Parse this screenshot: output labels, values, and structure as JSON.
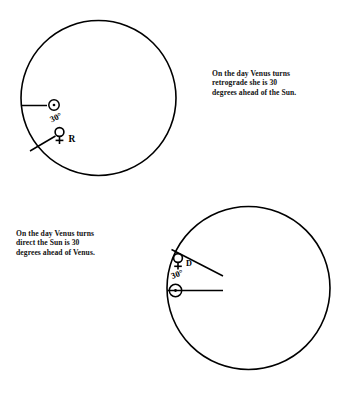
{
  "figure": {
    "background_color": "#ffffff",
    "ink_color": "#000000"
  },
  "captions": {
    "retrograde": "On the day Venus turns\nretrograde she is 30\ndegrees ahead of the Sun.",
    "direct": "On the day Venus turns\ndirect the Sun is 30\ndegrees ahead of Venus."
  },
  "diagrams": [
    {
      "id": "retrograde-chart",
      "name": "retrograde-wheel",
      "circle": {
        "cx": 98.5,
        "cy": 98,
        "r": 77.5
      },
      "bodies": [
        {
          "name": "sun",
          "symbol": "☉",
          "label": "",
          "x": 54,
          "y": 105,
          "radius_line": {
            "x1": 22,
            "y1": 105,
            "x2": 47,
            "y2": 105
          }
        },
        {
          "name": "venus",
          "symbol": "♀",
          "label": "R",
          "x": 60,
          "y": 135,
          "radius_line": {
            "x1": 31,
            "y1": 150,
            "x2": 54,
            "y2": 136
          }
        }
      ],
      "angle_label": "30°",
      "angle_label_x": 57,
      "angle_label_y": 120
    },
    {
      "id": "direct-chart",
      "name": "direct-wheel",
      "circle": {
        "cx": 248.5,
        "cy": 288,
        "r": 81.5
      },
      "bodies": [
        {
          "name": "venus",
          "symbol": "♀",
          "label": "D",
          "x": 178,
          "y": 260,
          "radius_line": {
            "x1": 172,
            "y1": 250,
            "x2": 222,
            "y2": 275
          }
        },
        {
          "name": "sun",
          "symbol": "☉",
          "label": "",
          "x": 176,
          "y": 291,
          "radius_line": {
            "x1": 167,
            "y1": 291,
            "x2": 222,
            "y2": 291
          }
        }
      ],
      "angle_label": "30°",
      "angle_label_x": 177,
      "angle_label_y": 277
    }
  ]
}
